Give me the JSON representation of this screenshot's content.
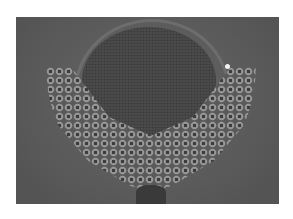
{
  "image": {
    "description": "Grayscale photograph of a circular mesh disc surrounded by a crescent of packed ring-shaped beads",
    "colors": {
      "background": "#5a5a5a",
      "mesh": "#4a4a4a",
      "beads": "#9a9a9a",
      "highlight": "#f2f2f2"
    }
  }
}
